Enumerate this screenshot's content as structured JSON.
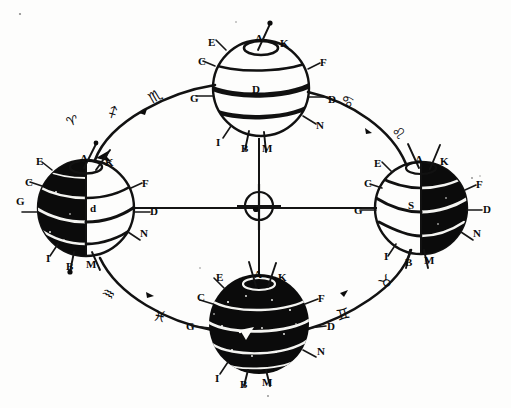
{
  "figure": {
    "ink_color": "#0b0b0b",
    "paper_color": "#fdfdfc",
    "width": 511,
    "height": 408
  },
  "center": {
    "name": "sun",
    "symbol": "☉",
    "label": "o",
    "description": "Sun marked by circle-with-dot at the centre of the orbit"
  },
  "globes": [
    {
      "id": "top",
      "position": "top",
      "season": "fully-illuminated",
      "shading": "light",
      "center_label": "D",
      "labels": {
        "pole_north": "A",
        "pole_north_right": "K",
        "upper_left_outer": "E",
        "left_upper": "C",
        "right_upper": "F",
        "left_equator": "G",
        "right_equator": "D",
        "right_lower": "N",
        "lower_left": "I",
        "bottom_left": "B",
        "bottom_right": "M"
      }
    },
    {
      "id": "left",
      "position": "left",
      "season": "half-lit-left-dark",
      "shading": "left-dark",
      "center_label": "d",
      "labels": {
        "pole_north": "A",
        "pole_north_right": "K",
        "upper_left_outer": "E",
        "left_upper": "C",
        "right_upper": "F",
        "left_equator": "G",
        "right_equator": "D",
        "right_lower": "N",
        "lower_left": "I",
        "bottom_left": "B",
        "bottom_right": "M"
      }
    },
    {
      "id": "right",
      "position": "right",
      "season": "half-lit-right-dark",
      "shading": "right-dark",
      "center_label": "S",
      "labels": {
        "pole_north": "A",
        "pole_north_right": "K",
        "upper_left_outer": "E",
        "left_upper": "C",
        "right_upper": "F",
        "left_equator": "G",
        "right_equator": "D",
        "right_lower": "N",
        "lower_left": "I",
        "bottom_left": "B",
        "bottom_right": "M"
      }
    },
    {
      "id": "bottom",
      "position": "bottom",
      "season": "fully-dark",
      "shading": "dark",
      "center_label": "",
      "labels": {
        "pole_north": "A",
        "pole_north_right": "K",
        "upper_left_outer": "E",
        "left_upper": "C",
        "right_upper": "F",
        "left_equator": "G",
        "right_equator": "D",
        "right_lower": "N",
        "lower_left": "I",
        "bottom_left": "B",
        "bottom_right": "M"
      }
    }
  ],
  "zodiac_marks": [
    {
      "id": "upper-left-1",
      "glyph": "♈",
      "name": "aries"
    },
    {
      "id": "upper-left-2",
      "glyph": "♐",
      "name": "sagittarius"
    },
    {
      "id": "upper-left-3",
      "glyph": "♏",
      "name": "scorpio"
    },
    {
      "id": "upper-right-1",
      "glyph": "♋",
      "name": "gemini"
    },
    {
      "id": "upper-right-2",
      "glyph": "♌",
      "name": "leo"
    },
    {
      "id": "lower-left-1",
      "glyph": "♒",
      "name": "aquarius"
    },
    {
      "id": "lower-left-2",
      "glyph": "♓",
      "name": "pisces"
    },
    {
      "id": "lower-right-1",
      "glyph": "♊",
      "name": "capricorn"
    },
    {
      "id": "lower-right-2",
      "glyph": "♉",
      "name": "taurus"
    }
  ],
  "axes": {
    "horizontal": "line joining left globe and right globe through the Sun",
    "vertical": "line joining top globe and bottom globe through the Sun"
  }
}
